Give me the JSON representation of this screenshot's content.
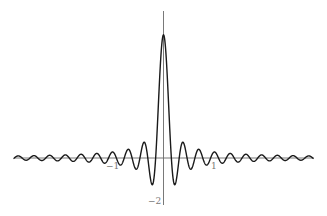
{
  "chart_data": {
    "type": "line",
    "title": "",
    "xlabel": "",
    "ylabel": "",
    "function": "A*sin(w*x)/(w*x)",
    "params": {
      "A": 5.6,
      "w": 20
    },
    "xlim": [
      -3,
      3
    ],
    "ylim": [
      -2,
      6
    ],
    "grid": false,
    "legend": null,
    "x_tick_labels": [
      {
        "value": -1,
        "label": "−1"
      },
      {
        "value": 1,
        "label": "1"
      }
    ],
    "y_tick_labels": [
      {
        "value": -2,
        "label": "−2"
      }
    ],
    "series": [
      {
        "name": "sinc curve",
        "x": [
          -3,
          -2.5,
          -2,
          -1.5,
          -1,
          -0.5,
          -0.3,
          -0.23,
          -0.157,
          0,
          0.157,
          0.23,
          0.3,
          0.5,
          1,
          1.5,
          2,
          2.5,
          3
        ],
        "y": [
          -0.09,
          -0.01,
          0.21,
          -0.05,
          0.26,
          -0.3,
          -0.26,
          -1.3,
          0,
          5.6,
          0,
          -1.3,
          -0.26,
          -0.3,
          0.26,
          -0.05,
          0.21,
          -0.01,
          -0.09
        ]
      }
    ],
    "color": "#1a1a1a",
    "axis_color": "#6a6a6a"
  },
  "axes": {
    "x_label_neg1": "−1",
    "x_label_pos1": "1",
    "y_label_neg2": "−2"
  }
}
